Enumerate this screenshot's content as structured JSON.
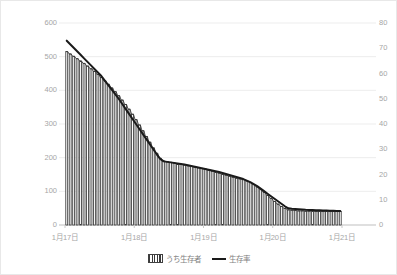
{
  "chart_data": {
    "type": "bar",
    "title": "",
    "xlabel": "",
    "ylabel": "",
    "grid": true,
    "legend_position": "bottom",
    "x_tick_labels": [
      "1月17日",
      "1月18日",
      "1月19日",
      "1月20日",
      "1月21日"
    ],
    "axes": {
      "left": {
        "label": "うち生存者",
        "min": 0,
        "max": 600,
        "step": 100,
        "ticks": [
          "0",
          "100",
          "200",
          "300",
          "400",
          "500",
          "600"
        ]
      },
      "right": {
        "label": "生存率",
        "min": 0,
        "max": 80,
        "step": 10,
        "ticks": [
          "0",
          "10",
          "20",
          "30",
          "40",
          "50",
          "60",
          "70",
          "80"
        ]
      }
    },
    "series": [
      {
        "name": "うち生存者",
        "type": "bar",
        "axis": "left",
        "color": "#3a3a3a",
        "fill": "vertical-stripes",
        "values": [
          515,
          508,
          501,
          494,
          487,
          480,
          472,
          464,
          456,
          447,
          438,
          428,
          418,
          407,
          396,
          384,
          371,
          358,
          344,
          329,
          313,
          297,
          280,
          263,
          246,
          229,
          213,
          198,
          190,
          188,
          186,
          184,
          182,
          180,
          178,
          176,
          174,
          172,
          170,
          168,
          166,
          163,
          160,
          157,
          154,
          151,
          148,
          145,
          142,
          139,
          137,
          135,
          131,
          126,
          120,
          113,
          105,
          97,
          88,
          79,
          70,
          62,
          55,
          49,
          45,
          44,
          43,
          42,
          42,
          41,
          41,
          41,
          40,
          40,
          40,
          40,
          40,
          40,
          40,
          40
        ]
      },
      {
        "name": "生存率",
        "type": "line",
        "axis": "right",
        "color": "#1a1a1a",
        "values": [
          73.0,
          71.6,
          70.2,
          68.8,
          67.4,
          66.0,
          64.6,
          63.2,
          61.8,
          60.4,
          59.0,
          57.2,
          55.4,
          53.6,
          51.8,
          50.0,
          48.0,
          46.0,
          44.0,
          42.0,
          40.0,
          38.0,
          36.0,
          34.0,
          32.0,
          30.0,
          28.0,
          26.2,
          25.2,
          25.0,
          24.8,
          24.6,
          24.4,
          24.2,
          24.0,
          23.7,
          23.4,
          23.1,
          22.8,
          22.5,
          22.2,
          21.9,
          21.6,
          21.3,
          21.0,
          20.6,
          20.2,
          19.8,
          19.4,
          19.0,
          18.6,
          18.2,
          17.6,
          17.0,
          16.2,
          15.4,
          14.4,
          13.4,
          12.4,
          11.4,
          10.4,
          9.4,
          8.4,
          7.4,
          6.6,
          6.4,
          6.3,
          6.2,
          6.1,
          6.0,
          5.95,
          5.9,
          5.85,
          5.8,
          5.75,
          5.7,
          5.65,
          5.6,
          5.55,
          5.5
        ]
      }
    ]
  },
  "legend": {
    "items": [
      {
        "label": "うち生存者",
        "swatch": "bars-swatch"
      },
      {
        "label": "生存率",
        "swatch": "line-swatch"
      }
    ]
  }
}
